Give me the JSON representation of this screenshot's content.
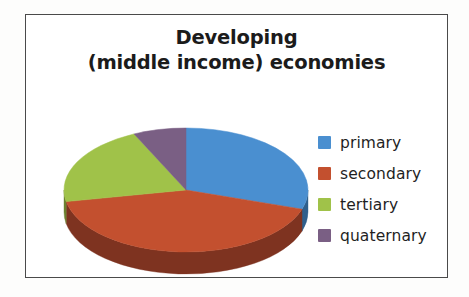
{
  "figure": {
    "background_color": "#fdfdfc",
    "frame_color": "#4a4a4a"
  },
  "title": {
    "line1": "Developing",
    "line2": "(middle income) economies",
    "color": "#1b1b1b"
  },
  "legend": {
    "position": "right",
    "items": [
      {
        "label": "primary",
        "color": "#4a8fd0"
      },
      {
        "label": "secondary",
        "color": "#c3502f"
      },
      {
        "label": "tertiary",
        "color": "#a0c martin"
      },
      {
        "label": "quaternary",
        "color": "#7a5f84"
      }
    ]
  },
  "chart_data": {
    "type": "pie",
    "title": "Developing (middle income) economies",
    "subtitle": "",
    "xlabel": "",
    "ylabel": "",
    "three_d": true,
    "start_angle_deg": 0,
    "direction": "clockwise",
    "labels": [
      "primary",
      "secondary",
      "tertiary",
      "quaternary"
    ],
    "values": [
      30,
      42,
      21,
      7
    ],
    "units": "percent",
    "colors": [
      "#4a8fd0",
      "#c3502f",
      "#a0c249",
      "#7a5f84"
    ],
    "side_colors": [
      "#2f5f8c",
      "#7e3320",
      "#6c8230",
      "#503c58"
    ],
    "legend_position": "right",
    "grid": false,
    "data_labels_shown": false,
    "slices": [
      {
        "name": "primary",
        "value": 30,
        "color": "#4a8fd0",
        "start_deg": 0,
        "end_deg": 108
      },
      {
        "name": "secondary",
        "value": 42,
        "color": "#c3502f",
        "start_deg": 108,
        "end_deg": 259
      },
      {
        "name": "tertiary",
        "value": 21,
        "color": "#a0c249",
        "start_deg": 259,
        "end_deg": 335
      },
      {
        "name": "quaternary",
        "value": 7,
        "color": "#7a5f84",
        "start_deg": 335,
        "end_deg": 360
      }
    ]
  }
}
